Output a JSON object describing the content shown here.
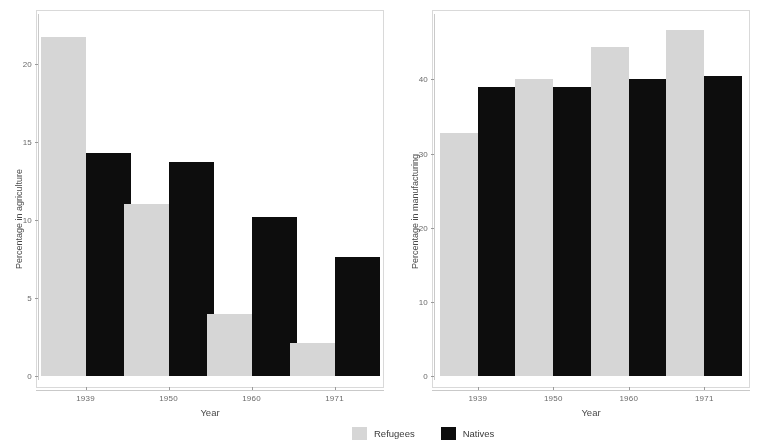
{
  "figure": {
    "background": "#ffffff",
    "refugees_color": "#d6d6d6",
    "natives_color": "#0d0d0d"
  },
  "legend": {
    "position": "bottom-center",
    "items": [
      {
        "label": "Refugees",
        "color": "#d6d6d6",
        "swatch": "refugees-swatch"
      },
      {
        "label": "Natives",
        "color": "#0d0d0d",
        "swatch": "natives-swatch"
      }
    ]
  },
  "chart_data": [
    {
      "type": "bar",
      "title": "",
      "xlabel": "Year",
      "ylabel": "Percentage in agriculture",
      "categories": [
        "1939",
        "1950",
        "1960",
        "1971"
      ],
      "yticks": [
        0,
        5,
        10,
        15,
        20
      ],
      "ylim": [
        0,
        22.8
      ],
      "grid": false,
      "legend_position": "bottom-center",
      "series": [
        {
          "name": "Refugees",
          "color": "#d6d6d6",
          "values": [
            21.7,
            11.0,
            4.0,
            2.1
          ]
        },
        {
          "name": "Natives",
          "color": "#0d0d0d",
          "values": [
            14.3,
            13.7,
            10.2,
            7.6
          ]
        }
      ]
    },
    {
      "type": "bar",
      "title": "",
      "xlabel": "Year",
      "ylabel": "Percentage in manufacturing",
      "categories": [
        "1939",
        "1950",
        "1960",
        "1971"
      ],
      "yticks": [
        0,
        10,
        20,
        30,
        40
      ],
      "ylim": [
        0,
        48
      ],
      "grid": false,
      "legend_position": "bottom-center",
      "series": [
        {
          "name": "Refugees",
          "color": "#d6d6d6",
          "values": [
            32.7,
            40.0,
            44.4,
            46.6
          ]
        },
        {
          "name": "Natives",
          "color": "#0d0d0d",
          "values": [
            39.0,
            38.9,
            40.1,
            40.4
          ]
        }
      ]
    }
  ]
}
